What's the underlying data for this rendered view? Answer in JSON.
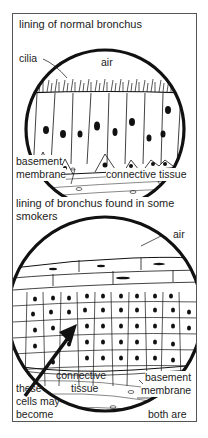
{
  "figure": {
    "panels": [
      {
        "title": "lining of normal bronchus",
        "labels": {
          "cilia": "cilia",
          "air": "air",
          "basement_1": "basement",
          "basement_2": "membrane",
          "connective": "connective tissue"
        }
      },
      {
        "title_line1": "lining of bronchus found in some",
        "title_line2": "smokers",
        "labels": {
          "air": "air",
          "connective_1": "connective",
          "connective_2": "tissue",
          "basement_1": "basement",
          "basement_2": "membrane",
          "cancer_1": "these",
          "cancer_2": "cells may",
          "cancer_3": "become",
          "cancer_4": "cancerous",
          "magnified_1": "both are",
          "magnified_2": "much magnified"
        }
      }
    ],
    "colors": {
      "ink": "#111111",
      "border": "#555555",
      "background": "#ffffff"
    }
  }
}
